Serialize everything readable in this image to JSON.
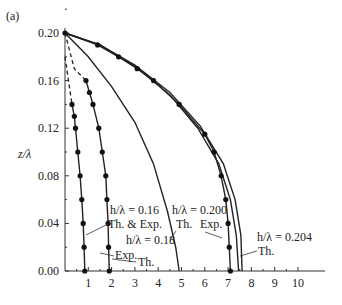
{
  "chart_data": {
    "type": "line",
    "panel_label": "(a)",
    "xlabel": "",
    "ylabel": "z/λ",
    "xlim": [
      0,
      11
    ],
    "ylim": [
      0,
      0.2
    ],
    "x_ticks": [
      "1",
      "2",
      "3",
      "4",
      "5",
      "6",
      "7",
      "8",
      "9",
      "10"
    ],
    "y_ticks": [
      "0.00",
      "0.04",
      "0.08",
      "0.12",
      "0.16",
      "0.20"
    ],
    "grid": false,
    "series": [
      {
        "name": "h/λ = 0.16 Th. & Exp.",
        "style": "solid+markers",
        "dashed": [
          [
            0.0,
            0.18
          ],
          [
            0.15,
            0.16
          ],
          [
            0.3,
            0.14
          ]
        ],
        "points": [
          [
            0.3,
            0.14
          ],
          [
            0.4,
            0.13
          ],
          [
            0.45,
            0.12
          ],
          [
            0.55,
            0.1
          ],
          [
            0.65,
            0.08
          ],
          [
            0.72,
            0.06
          ],
          [
            0.78,
            0.04
          ],
          [
            0.82,
            0.02
          ],
          [
            0.85,
            0.0
          ]
        ]
      },
      {
        "name": "h/λ = 0.18 Exp.",
        "style": "solid+markers",
        "dashed": [
          [
            0.0,
            0.2
          ],
          [
            0.4,
            0.17
          ],
          [
            0.9,
            0.16
          ]
        ],
        "points": [
          [
            0.9,
            0.16
          ],
          [
            1.05,
            0.15
          ],
          [
            1.2,
            0.14
          ],
          [
            1.45,
            0.12
          ],
          [
            1.6,
            0.1
          ],
          [
            1.75,
            0.08
          ],
          [
            1.8,
            0.06
          ],
          [
            1.85,
            0.04
          ],
          [
            1.87,
            0.02
          ],
          [
            1.9,
            0.0
          ]
        ]
      },
      {
        "name": "h/λ = 0.18 Th.",
        "style": "solid",
        "points": [
          [
            0.0,
            0.2
          ],
          [
            1.0,
            0.18
          ],
          [
            2.0,
            0.155
          ],
          [
            3.0,
            0.125
          ],
          [
            3.8,
            0.09
          ],
          [
            4.4,
            0.05
          ],
          [
            4.75,
            0.02
          ],
          [
            4.9,
            0.0
          ]
        ]
      },
      {
        "name": "h/λ = 0.200 Exp.",
        "style": "solid+markers",
        "points": [
          [
            0.0,
            0.2
          ],
          [
            1.4,
            0.19
          ],
          [
            2.3,
            0.18
          ],
          [
            3.1,
            0.17
          ],
          [
            3.8,
            0.16
          ],
          [
            4.9,
            0.14
          ],
          [
            6.0,
            0.115
          ],
          [
            6.4,
            0.1
          ],
          [
            6.7,
            0.08
          ],
          [
            6.9,
            0.06
          ],
          [
            7.0,
            0.04
          ],
          [
            7.05,
            0.02
          ],
          [
            7.1,
            0.0
          ]
        ]
      },
      {
        "name": "h/λ = 0.200 Th.",
        "style": "solid",
        "points": [
          [
            0.0,
            0.2
          ],
          [
            1.5,
            0.19
          ],
          [
            3.0,
            0.172
          ],
          [
            4.5,
            0.148
          ],
          [
            5.7,
            0.12
          ],
          [
            6.6,
            0.09
          ],
          [
            7.1,
            0.06
          ],
          [
            7.35,
            0.03
          ],
          [
            7.45,
            0.0
          ]
        ]
      },
      {
        "name": "h/λ = 0.204 Th.",
        "style": "solid",
        "points": [
          [
            0.0,
            0.2
          ],
          [
            1.5,
            0.19
          ],
          [
            3.0,
            0.173
          ],
          [
            4.5,
            0.15
          ],
          [
            5.8,
            0.122
          ],
          [
            6.8,
            0.09
          ],
          [
            7.3,
            0.06
          ],
          [
            7.55,
            0.03
          ],
          [
            7.6,
            0.0
          ]
        ]
      }
    ],
    "annotations": [
      {
        "text": "h/λ = 0.16",
        "x": 1.9,
        "y": 0.052
      },
      {
        "text": "Th. & Exp.",
        "x": 1.9,
        "y": 0.038
      },
      {
        "text": "h/λ = 0.18",
        "x": 2.3,
        "y": 0.025
      },
      {
        "text": "Exp.",
        "x": 1.6,
        "y": 0.011
      },
      {
        "text": "Th.",
        "x": 2.3,
        "y": 0.003
      },
      {
        "text": "h/λ = 0.200",
        "x": 4.6,
        "y": 0.052
      },
      {
        "text": "Th.",
        "x": 4.8,
        "y": 0.038
      },
      {
        "text": "Exp.",
        "x": 5.7,
        "y": 0.038
      },
      {
        "text": "h/λ = 0.204",
        "x": 7.9,
        "y": 0.031
      },
      {
        "text": "Th.",
        "x": 8.0,
        "y": 0.018
      }
    ]
  },
  "labels": {
    "panel": "(a)",
    "ylabel": "z/λ",
    "a016": "h/λ = 0.16",
    "a016b": "Th. & Exp.",
    "a018": "h/λ = 0.18",
    "aExp": "Exp.",
    "aTh": "Th.",
    "a200": "h/λ = 0.200",
    "a200th": "Th.",
    "a200exp": "Exp.",
    "a204": "h/λ = 0.204",
    "a204th": "Th."
  }
}
